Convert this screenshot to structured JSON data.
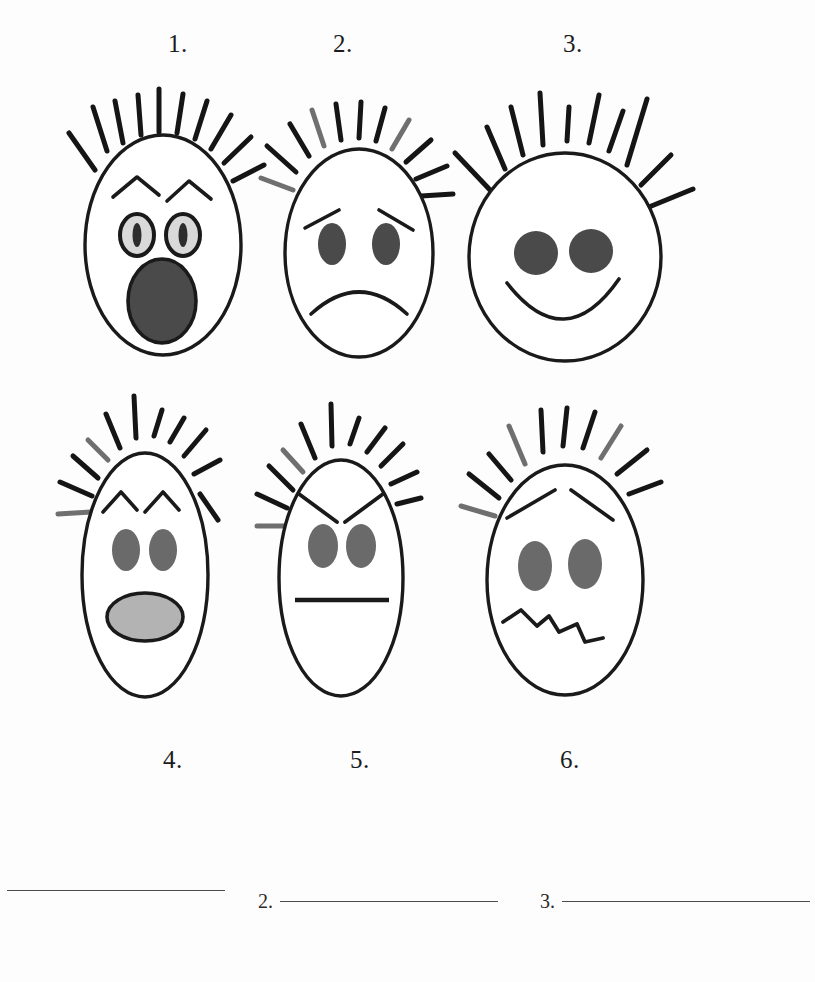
{
  "worksheet": {
    "title": "Emotion Faces Matching Worksheet",
    "background_color": "#fdfdfd",
    "ink_color": "#1a1a1a"
  },
  "palette": {
    "outline": "#1a1a1a",
    "hair_black": "#151515",
    "hair_gray": "#6f6f6f",
    "eye_dark": "#4a4a4a",
    "eye_light": "#d9d9d9",
    "mouth_dark": "#4a4a4a",
    "mouth_light": "#b3b3b3",
    "rule_gray": "#4b4b4b"
  },
  "faces": [
    {
      "number": "1.",
      "label_x": 168,
      "label_y": 30,
      "emotion": "surprised",
      "head_shape": "tall-oval",
      "eye_style": "ringed-light-with-pupil",
      "eyebrow_style": "raised-peaks",
      "mouth_style": "open-oval-dark",
      "hair_spikes": 10
    },
    {
      "number": "2.",
      "label_x": 333,
      "label_y": 30,
      "emotion": "sad",
      "head_shape": "oval",
      "eye_style": "solid-oval-dark",
      "eyebrow_style": "sloped-outer-down",
      "mouth_style": "frown-curve",
      "hair_spikes": 11
    },
    {
      "number": "3.",
      "label_x": 563,
      "label_y": 30,
      "emotion": "happy",
      "head_shape": "wide-round",
      "eye_style": "solid-round-dark",
      "eyebrow_style": "none",
      "mouth_style": "smile-curve",
      "hair_spikes": 10
    },
    {
      "number": "4.",
      "label_x": 163,
      "label_y": 746,
      "emotion": "shocked",
      "head_shape": "narrow-tall-oval",
      "eye_style": "solid-oval-gray",
      "eyebrow_style": "raised-peaks",
      "mouth_style": "open-oval-light",
      "hair_spikes": 11
    },
    {
      "number": "5.",
      "label_x": 350,
      "label_y": 746,
      "emotion": "angry",
      "head_shape": "narrow-tall-oval",
      "eye_style": "solid-oval-gray",
      "eyebrow_style": "angled-down-center",
      "mouth_style": "straight-line",
      "hair_spikes": 11
    },
    {
      "number": "6.",
      "label_x": 560,
      "label_y": 746,
      "emotion": "worried",
      "head_shape": "oval",
      "eye_style": "solid-oval-gray",
      "eyebrow_style": "raised-inner",
      "mouth_style": "wavy-squiggle",
      "hair_spikes": 10
    }
  ],
  "answer_lines": [
    {
      "number": "",
      "x": 0,
      "width": 218,
      "truncated": true
    },
    {
      "number": "2.",
      "x": 258,
      "width": 218,
      "truncated": false
    },
    {
      "number": "3.",
      "x": 540,
      "width": 265,
      "truncated": false
    }
  ]
}
